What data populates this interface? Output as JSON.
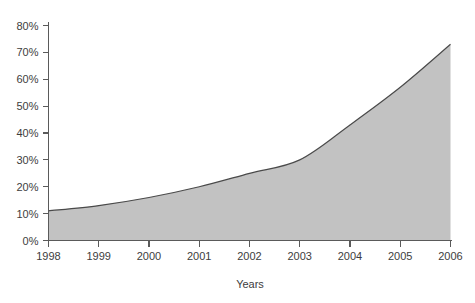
{
  "chart_data": {
    "type": "area",
    "title": "",
    "subtitle": "",
    "xlabel": "Years",
    "ylabel": "",
    "categories": [
      "1998",
      "1999",
      "2000",
      "2001",
      "2002",
      "2003",
      "2004",
      "2005",
      "2006"
    ],
    "x": [
      1998,
      1999,
      2000,
      2001,
      2002,
      2003,
      2004,
      2005,
      2006
    ],
    "values": [
      11,
      13,
      16,
      20,
      25,
      30,
      43,
      57,
      73
    ],
    "series": [
      {
        "name": "",
        "values": [
          11,
          13,
          16,
          20,
          25,
          30,
          43,
          57,
          73
        ]
      }
    ],
    "ylim": [
      0,
      80
    ],
    "xlim": [
      1998,
      2006
    ],
    "yticks": [
      0,
      10,
      20,
      30,
      40,
      50,
      60,
      70,
      80
    ],
    "ytick_labels": [
      "0%",
      "10%",
      "20%",
      "30%",
      "40%",
      "50%",
      "60%",
      "70%",
      "80%"
    ],
    "xtick_labels": [
      "1998",
      "1999",
      "2000",
      "2001",
      "2002",
      "2003",
      "2004",
      "2005",
      "2006"
    ],
    "grid": false,
    "legend": "none",
    "annotations": [],
    "colors": {
      "area_fill": "#c2c2c2",
      "line": "#4a4a4a",
      "axis": "#5a5a5a",
      "text": "#3d3d3d",
      "background": "#ffffff"
    }
  }
}
